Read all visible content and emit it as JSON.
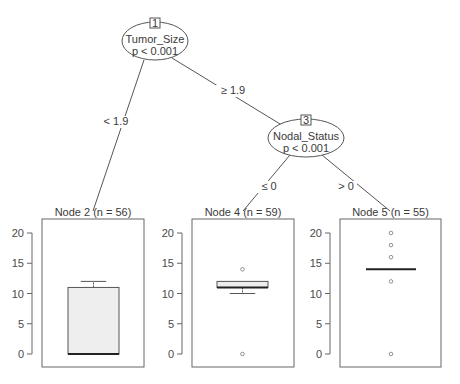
{
  "chart_data": {
    "type": "tree-boxplot",
    "title": "",
    "inner_nodes": [
      {
        "id": "1",
        "variable": "Tumor_Size",
        "p_label": "p < 0.001",
        "cx": 155,
        "cy": 41
      },
      {
        "id": "3",
        "variable": "Nodal_Status",
        "p_label": "p < 0.001",
        "cx": 306,
        "cy": 138
      }
    ],
    "edges": [
      {
        "from": "1",
        "to": "2",
        "label": "< 1.9",
        "x1": 144,
        "y1": 60,
        "x2": 93,
        "y2": 211,
        "lx": 116,
        "ly": 125
      },
      {
        "from": "1",
        "to": "3",
        "label": "≥ 1.9",
        "x1": 172,
        "y1": 58,
        "x2": 285,
        "y2": 127,
        "lx": 233,
        "ly": 94
      },
      {
        "from": "3",
        "to": "4",
        "label": "≤ 0",
        "x1": 290,
        "y1": 155,
        "x2": 243,
        "y2": 211,
        "lx": 269,
        "ly": 190
      },
      {
        "from": "3",
        "to": "5",
        "label": "> 0",
        "x1": 322,
        "y1": 155,
        "x2": 390,
        "y2": 211,
        "lx": 346,
        "ly": 190
      }
    ],
    "terminal_nodes": [
      {
        "id": "2",
        "title": "Node 2 (n = 56)",
        "n": 56,
        "panel": {
          "x": 42,
          "y": 219,
          "w": 102,
          "h": 148
        },
        "box": {
          "q1": 0,
          "median": 0,
          "q3": 11,
          "whisker_low": 0,
          "whisker_high": 12,
          "x_left": 68,
          "x_right": 119,
          "fill": "#eeeeee"
        },
        "outliers": []
      },
      {
        "id": "4",
        "title": "Node 4 (n = 59)",
        "n": 59,
        "panel": {
          "x": 192,
          "y": 219,
          "w": 102,
          "h": 148
        },
        "box": {
          "q1": 11,
          "median": 11,
          "q3": 12,
          "whisker_low": 10,
          "whisker_high": 12,
          "x_left": 217,
          "x_right": 268,
          "fill": "#eeeeee"
        },
        "outliers": [
          14,
          0
        ]
      },
      {
        "id": "5",
        "title": "Node 5 (n = 55)",
        "n": 55,
        "panel": {
          "x": 340,
          "y": 219,
          "w": 101,
          "h": 148
        },
        "box": {
          "q1": 14,
          "median": 14,
          "q3": 14,
          "whisker_low": 14,
          "whisker_high": 14,
          "x_left": 366,
          "x_right": 416,
          "fill": "#eeeeee"
        },
        "outliers": [
          20,
          18,
          16,
          12,
          0
        ]
      }
    ],
    "y_axis": {
      "ticks": [
        0,
        5,
        10,
        15,
        20
      ],
      "ylim": [
        -2,
        22
      ],
      "y_at_0": 354,
      "px_per_unit": 6.05
    },
    "xlabel": "",
    "ylabel": "",
    "grid": false,
    "legend": null
  }
}
